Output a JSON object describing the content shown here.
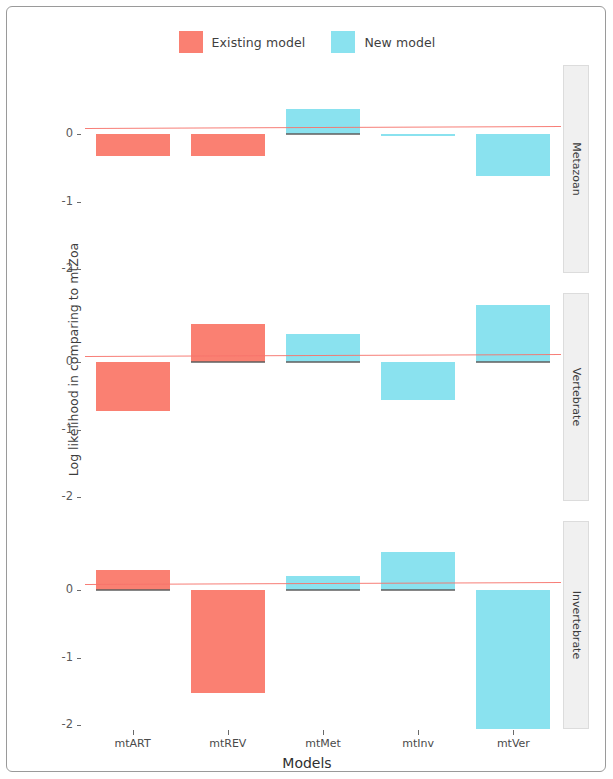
{
  "chart_data": {
    "type": "bar",
    "title": "",
    "xlabel": "Models",
    "ylabel": "Log likelihood in comparing to mtZoa",
    "categories": [
      "mtART",
      "mtREV",
      "mtMet",
      "mtInv",
      "mtVer"
    ],
    "facets": [
      "Metazoan",
      "Vertebrate",
      "Invertebrate"
    ],
    "facet_position": "right-strip",
    "ylim": [
      -2.35,
      0.95
    ],
    "yticks": [
      0,
      -1,
      -2
    ],
    "ytick_labels": [
      "0",
      "-1",
      "-2"
    ],
    "grid": false,
    "legend": {
      "position": "top-center",
      "entries": [
        {
          "name": "Existing model",
          "color": "#fa8072",
          "icon": "legend-swatch"
        },
        {
          "name": "New model",
          "color": "#8ae2ef",
          "icon": "legend-swatch"
        }
      ]
    },
    "reference_line": {
      "value": 0.1,
      "color": "#f6736b",
      "label": ""
    },
    "panels": [
      {
        "facet": "Metazoan",
        "bars": [
          {
            "category": "mtART",
            "value": -0.33,
            "series": "Existing model",
            "color": "#fa8072"
          },
          {
            "category": "mtREV",
            "value": -0.33,
            "series": "Existing model",
            "color": "#fa8072"
          },
          {
            "category": "mtMet",
            "value": 0.37,
            "series": "New model",
            "color": "#8ae2ef"
          },
          {
            "category": "mtInv",
            "value": -0.02,
            "series": "New model",
            "color": "#8ae2ef"
          },
          {
            "category": "mtVer",
            "value": -0.62,
            "series": "New model",
            "color": "#8ae2ef"
          }
        ]
      },
      {
        "facet": "Vertebrate",
        "bars": [
          {
            "category": "mtART",
            "value": -0.72,
            "series": "Existing model",
            "color": "#fa8072"
          },
          {
            "category": "mtREV",
            "value": 0.56,
            "series": "Existing model",
            "color": "#fa8072"
          },
          {
            "category": "mtMet",
            "value": 0.41,
            "series": "New model",
            "color": "#8ae2ef"
          },
          {
            "category": "mtInv",
            "value": -0.56,
            "series": "New model",
            "color": "#8ae2ef"
          },
          {
            "category": "mtVer",
            "value": 0.84,
            "series": "New model",
            "color": "#8ae2ef"
          }
        ]
      },
      {
        "facet": "Invertebrate",
        "bars": [
          {
            "category": "mtART",
            "value": 0.29,
            "series": "Existing model",
            "color": "#fa8072"
          },
          {
            "category": "mtREV",
            "value": -1.53,
            "series": "Existing model",
            "color": "#fa8072"
          },
          {
            "category": "mtMet",
            "value": 0.21,
            "series": "New model",
            "color": "#8ae2ef"
          },
          {
            "category": "mtInv",
            "value": 0.56,
            "series": "New model",
            "color": "#8ae2ef"
          },
          {
            "category": "mtVer",
            "value": -2.09,
            "series": "New model",
            "color": "#8ae2ef"
          }
        ]
      }
    ]
  }
}
